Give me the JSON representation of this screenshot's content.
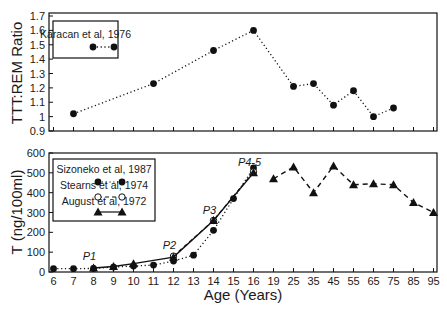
{
  "chart_data": [
    {
      "type": "line",
      "panel": "top",
      "title": "",
      "xlabel": "",
      "ylabel": "TTT:REM Ratio",
      "ylim": [
        0.9,
        1.7
      ],
      "yticks": [
        "0.9",
        "1",
        "1.1",
        "1.2",
        "1.3",
        "1.4",
        "1.5",
        "1.6",
        "1.7"
      ],
      "grid": false,
      "legend_position": "upper-left",
      "categories": [
        "6",
        "7",
        "8",
        "9",
        "10",
        "11",
        "12",
        "13",
        "14",
        "15",
        "16",
        "19",
        "25",
        "35",
        "45",
        "55",
        "65",
        "75",
        "85",
        "95"
      ],
      "series": [
        {
          "name": "Karacan et al, 1976",
          "style": "dotted-filled-circle",
          "points": [
            {
              "x": "7",
              "y": 1.02
            },
            {
              "x": "11",
              "y": 1.23
            },
            {
              "x": "14",
              "y": 1.46
            },
            {
              "x": "16",
              "y": 1.6
            },
            {
              "x": "25",
              "y": 1.21
            },
            {
              "x": "35",
              "y": 1.23
            },
            {
              "x": "45",
              "y": 1.08
            },
            {
              "x": "55",
              "y": 1.18
            },
            {
              "x": "65",
              "y": 1.0
            },
            {
              "x": "75",
              "y": 1.06
            }
          ]
        }
      ]
    },
    {
      "type": "line",
      "panel": "bottom",
      "title": "",
      "xlabel": "Age (Years)",
      "ylabel": "T (ng/100ml)",
      "ylim": [
        0,
        600
      ],
      "yticks": [
        "0",
        "100",
        "200",
        "300",
        "400",
        "500",
        "600"
      ],
      "grid": false,
      "legend_position": "upper-left",
      "categories": [
        "6",
        "7",
        "8",
        "9",
        "10",
        "11",
        "12",
        "13",
        "14",
        "15",
        "16",
        "19",
        "25",
        "35",
        "45",
        "55",
        "65",
        "75",
        "85",
        "95"
      ],
      "series": [
        {
          "name": "Sizoneko et al, 1987",
          "style": "dotted-filled-circle",
          "points": [
            {
              "x": "6",
              "y": 17
            },
            {
              "x": "7",
              "y": 17
            },
            {
              "x": "8",
              "y": 18
            },
            {
              "x": "9",
              "y": 25
            },
            {
              "x": "10",
              "y": 30
            },
            {
              "x": "11",
              "y": 35
            },
            {
              "x": "12",
              "y": 55
            },
            {
              "x": "13",
              "y": 85
            },
            {
              "x": "14",
              "y": 210
            },
            {
              "x": "15",
              "y": 370
            },
            {
              "x": "16",
              "y": 525
            }
          ]
        },
        {
          "name": "Stearns et al, 1974",
          "style": "dashed-open-circle",
          "points": [
            {
              "x": "12",
              "y": 80
            },
            {
              "x": "14",
              "y": 260
            },
            {
              "x": "16",
              "y": 505
            }
          ]
        },
        {
          "name": "August et al, 1972",
          "style": "solid-filled-triangle",
          "points": [
            {
              "x": "8",
              "y": 20
            },
            {
              "x": "9",
              "y": 28
            },
            {
              "x": "10",
              "y": 42
            },
            {
              "x": "12",
              "y": 75
            },
            {
              "x": "14",
              "y": 260
            },
            {
              "x": "16",
              "y": 500
            }
          ]
        },
        {
          "name": "Adult (dashed triangles)",
          "style": "dashed-filled-triangle",
          "points": [
            {
              "x": "19",
              "y": 470
            },
            {
              "x": "25",
              "y": 530
            },
            {
              "x": "35",
              "y": 400
            },
            {
              "x": "45",
              "y": 535
            },
            {
              "x": "55",
              "y": 440
            },
            {
              "x": "65",
              "y": 445
            },
            {
              "x": "75",
              "y": 440
            },
            {
              "x": "85",
              "y": 350
            },
            {
              "x": "95",
              "y": 300
            }
          ]
        }
      ],
      "annotations": [
        {
          "text": "P1",
          "x": "8",
          "y": 60
        },
        {
          "text": "P2",
          "x": "12",
          "y": 115
        },
        {
          "text": "P3",
          "x": "14",
          "y": 290
        },
        {
          "text": "P4-5",
          "x": "16",
          "y": 535
        }
      ]
    }
  ]
}
